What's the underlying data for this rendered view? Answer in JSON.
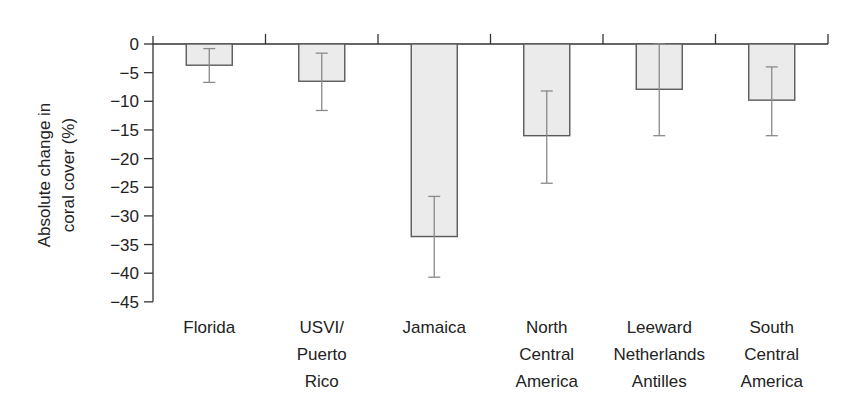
{
  "chart_data": {
    "type": "bar",
    "title": "",
    "xlabel": "",
    "ylabel": "Absolute change in coral cover (%)",
    "ylabel_lines": [
      "Absolute change in",
      "coral cover (%)"
    ],
    "ylim": [
      -45,
      0
    ],
    "yticks": [
      0,
      -5,
      -10,
      -15,
      -20,
      -25,
      -30,
      -35,
      -40,
      -45
    ],
    "ytick_labels": [
      "0",
      "−5",
      "−10",
      "−15",
      "−20",
      "−25",
      "−30",
      "−35",
      "−40",
      "−45"
    ],
    "grid": false,
    "legend": null,
    "categories": [
      "Florida",
      "USVI/ Puerto Rico",
      "Jamaica",
      "North Central America",
      "Leeward Netherlands Antilles",
      "South Central America"
    ],
    "category_label_lines": [
      [
        "Florida"
      ],
      [
        "USVI/",
        "Puerto",
        "Rico"
      ],
      [
        "Jamaica"
      ],
      [
        "North",
        "Central",
        "America"
      ],
      [
        "Leeward",
        "Netherlands",
        "Antilles"
      ],
      [
        "South",
        "Central",
        "America"
      ]
    ],
    "values": [
      -3.7,
      -6.5,
      -33.6,
      -16.0,
      -7.9,
      -9.8
    ],
    "error_bars": [
      {
        "upper": -0.8,
        "lower": -6.7
      },
      {
        "upper": -1.6,
        "lower": -11.6
      },
      {
        "upper": -26.6,
        "lower": -40.7
      },
      {
        "upper": -8.2,
        "lower": -24.3
      },
      {
        "upper": 0.0,
        "lower": -16.0
      },
      {
        "upper": -4.0,
        "lower": -16.0
      }
    ],
    "colors": {
      "bar_fill": "#ebebeb",
      "bar_stroke": "#5a5a5a",
      "error_bar": "#8a8a8a",
      "axis": "#333333"
    }
  }
}
